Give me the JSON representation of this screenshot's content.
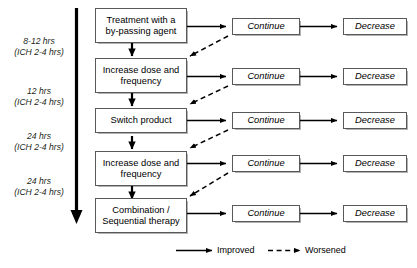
{
  "figure": {
    "timeline": {
      "name": "escalation-timeline-arrow",
      "labels": [
        {
          "primary": "8-12 hrs",
          "secondary": "(ICH 2-4 hrs)"
        },
        {
          "primary": "12 hrs",
          "secondary": "(ICH 2-4 hrs)"
        },
        {
          "primary": "24 hrs",
          "secondary": "(ICH 2-4 hrs)"
        },
        {
          "primary": "24 hrs",
          "secondary": "(ICH 2-4 hrs)"
        }
      ]
    },
    "steps": [
      {
        "line1": "Treatment with a",
        "line2": "by-passing agent"
      },
      {
        "line1": "Increase dose and",
        "line2": "frequency"
      },
      {
        "line1": "Switch product",
        "line2": ""
      },
      {
        "line1": "Increase dose and",
        "line2": "frequency"
      },
      {
        "line1": "Combination /",
        "line2": "Sequential therapy"
      }
    ],
    "outcomes": [
      {
        "continue": "Continue",
        "decrease": "Decrease"
      },
      {
        "continue": "Continue",
        "decrease": "Decrease"
      },
      {
        "continue": "Continue",
        "decrease": "Decrease"
      },
      {
        "continue": "Continue",
        "decrease": "Decrease"
      },
      {
        "continue": "Continue",
        "decrease": "Decrease"
      }
    ],
    "legend": [
      {
        "label": "Improved",
        "style": "solid"
      },
      {
        "label": "Worsened",
        "style": "dashed"
      }
    ],
    "colors": {
      "line": "#000000",
      "box_border": "#58595b",
      "text": "#000000",
      "time_label": "#231f20"
    }
  }
}
